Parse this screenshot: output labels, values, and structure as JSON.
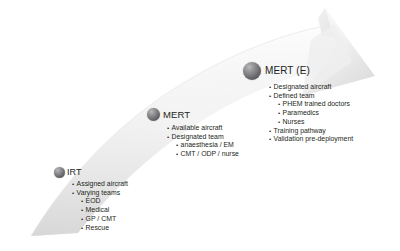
{
  "diagram": {
    "type": "curved-progression-arrow",
    "arrow": {
      "name": "capability-progression-arrow",
      "direction": "bottom-left-to-top-right",
      "fill_color": "#f1f1f1",
      "shade_color": "#d9d9d9",
      "edge_color": "#e2e2e2"
    },
    "marker_color": "#6c6c71",
    "text_color": "#231f20",
    "milestones": [
      {
        "id": "irt",
        "title": "IRT",
        "marker": "sphere-marker-irt",
        "bullets": [
          {
            "level": 1,
            "text": "Assigned aircraft"
          },
          {
            "level": 1,
            "text": "Varying teams"
          },
          {
            "level": 2,
            "text": "EOD"
          },
          {
            "level": 2,
            "text": "Medical"
          },
          {
            "level": 2,
            "text": "GP / CMT"
          },
          {
            "level": 2,
            "text": "Rescue"
          }
        ]
      },
      {
        "id": "mert",
        "title": "MERT",
        "marker": "sphere-marker-mert",
        "bullets": [
          {
            "level": 1,
            "text": "Available aircraft"
          },
          {
            "level": 1,
            "text": "Designated team"
          },
          {
            "level": 2,
            "text": "anaesthesia / EM"
          },
          {
            "level": 2,
            "text": "CMT / ODP / nurse"
          }
        ]
      },
      {
        "id": "merte",
        "title": "MERT (E)",
        "marker": "sphere-marker-merte",
        "bullets": [
          {
            "level": 1,
            "text": "Designated aircraft"
          },
          {
            "level": 1,
            "text": "Defined team"
          },
          {
            "level": 2,
            "text": "PHEM trained doctors"
          },
          {
            "level": 2,
            "text": "Paramedics"
          },
          {
            "level": 2,
            "text": "Nurses"
          },
          {
            "level": 1,
            "text": "Training pathway"
          },
          {
            "level": 1,
            "text": "Validation pre-deployment"
          }
        ]
      }
    ]
  }
}
